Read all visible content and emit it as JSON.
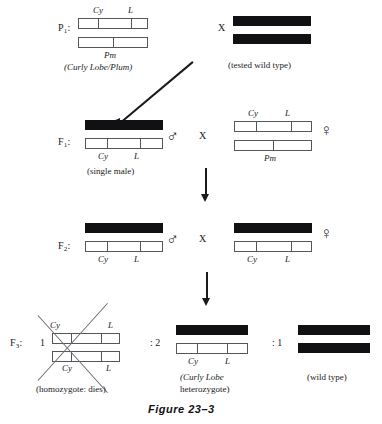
{
  "figure": {
    "caption": "Figure 23–3",
    "cross_symbol": "X",
    "male_symbol": "♂",
    "female_symbol": "♀"
  },
  "generations": {
    "p1": {
      "label": "P",
      "sub": "1",
      "label_full": "P₁:",
      "left": {
        "genes_top": [
          "Cy",
          "L"
        ],
        "genes_bottom": [
          "Pm"
        ],
        "caption": "(Curly Lobe/Plum)"
      },
      "right": {
        "caption": "(tested wild type)"
      }
    },
    "f1": {
      "label": "F",
      "sub": "1",
      "label_full": "F₁:",
      "male": {
        "genes": [
          "Cy",
          "L"
        ],
        "caption": "(single male)"
      },
      "female": {
        "genes_top": [
          "Cy",
          "L"
        ],
        "genes_bottom": [
          "Pm"
        ]
      }
    },
    "f2": {
      "label": "F",
      "sub": "2",
      "label_full": "F₂:",
      "male": {
        "genes": [
          "Cy",
          "L"
        ]
      },
      "female": {
        "genes": [
          "Cy",
          "L"
        ]
      }
    },
    "f3": {
      "label": "F",
      "sub": "3",
      "label_full": "F₃:",
      "ratio_1": "1",
      "ratio_2": ": 2",
      "ratio_3": ": 1",
      "homozygote": {
        "genes_top": [
          "Cy",
          "L"
        ],
        "genes_bottom": [
          "Cy",
          "L"
        ],
        "caption": "(homozygote:  dies)"
      },
      "heterozygote": {
        "genes": [
          "Cy",
          "L"
        ],
        "caption_line1": "(Curly Lobe",
        "caption_line2": "heterozygote)"
      },
      "wildtype": {
        "caption": "(wild type)"
      }
    }
  },
  "colors": {
    "bar_outline": "#55565a",
    "bar_solid": "#111113",
    "text": "#1a1a1a",
    "background": "#ffffff"
  }
}
